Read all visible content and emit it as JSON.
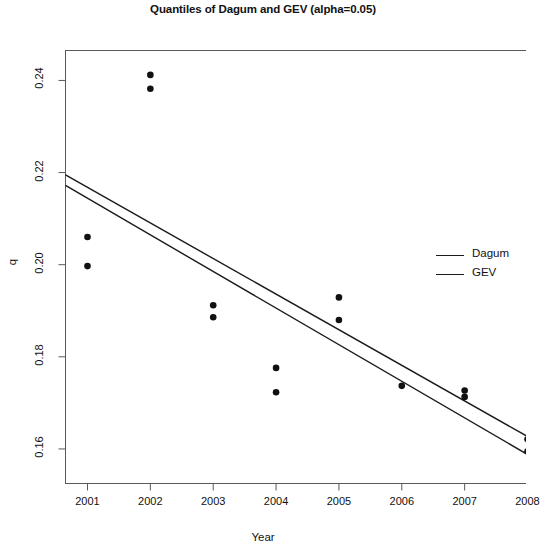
{
  "chart_data": {
    "type": "scatter",
    "title": "Quantiles of Dagum and GEV (alpha=0.05)",
    "xlabel": "Year",
    "ylabel": "q",
    "grid": false,
    "xlim": [
      2000.65,
      2008.0
    ],
    "ylim": [
      0.1525,
      0.2465
    ],
    "xticks": [
      2001,
      2002,
      2003,
      2004,
      2005,
      2006,
      2007,
      2008
    ],
    "xtick_labels": [
      "2001",
      "2002",
      "2003",
      "2004",
      "2005",
      "2006",
      "2007",
      "2008"
    ],
    "yticks": [
      0.16,
      0.18,
      0.2,
      0.22,
      0.24
    ],
    "ytick_labels": [
      "0.16",
      "0.18",
      "0.20",
      "0.22",
      "0.24"
    ],
    "legend_position": "right",
    "points": [
      {
        "x": 2001,
        "y": 0.206
      },
      {
        "x": 2001,
        "y": 0.1997
      },
      {
        "x": 2002,
        "y": 0.2412
      },
      {
        "x": 2002,
        "y": 0.2382
      },
      {
        "x": 2003,
        "y": 0.1912
      },
      {
        "x": 2003,
        "y": 0.1886
      },
      {
        "x": 2004,
        "y": 0.1776
      },
      {
        "x": 2004,
        "y": 0.1723
      },
      {
        "x": 2005,
        "y": 0.1929
      },
      {
        "x": 2005,
        "y": 0.188
      },
      {
        "x": 2006,
        "y": 0.1737
      },
      {
        "x": 2007,
        "y": 0.1727
      },
      {
        "x": 2007,
        "y": 0.1713
      },
      {
        "x": 2008,
        "y": 0.1621
      },
      {
        "x": 2008,
        "y": 0.1595
      }
    ],
    "series": [
      {
        "name": "Dagum",
        "type": "line",
        "x": [
          2000.65,
          2008.0
        ],
        "values": [
          0.2195,
          0.1627
        ]
      },
      {
        "name": "GEV",
        "type": "line",
        "x": [
          2000.65,
          2008.0
        ],
        "values": [
          0.2172,
          0.1588
        ]
      }
    ],
    "point_color": "#111111",
    "line_color": "#1a1a1a"
  },
  "legend": {
    "items": [
      {
        "label": "Dagum"
      },
      {
        "label": "GEV"
      }
    ]
  }
}
